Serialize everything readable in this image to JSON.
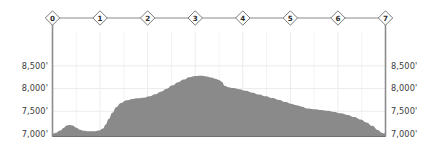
{
  "chart_data": {
    "type": "area",
    "title": "",
    "subtitle": "",
    "xlabel": "",
    "ylabel": "",
    "ylim": [
      6900,
      8800
    ],
    "xlim": [
      0,
      7
    ],
    "grid": true,
    "legend": "none",
    "y_ticks": [
      7000,
      7500,
      8000,
      8500
    ],
    "y_tick_labels_left": [
      "7,000'",
      "7,500'",
      "8,000'",
      "8,500'"
    ],
    "y_tick_labels_right": [
      "7,000'",
      "7,500'",
      "8,000'",
      "8,500'"
    ],
    "x_markers": [
      {
        "label": "0",
        "x": 0
      },
      {
        "label": "1",
        "x": 1
      },
      {
        "label": "2",
        "x": 2
      },
      {
        "label": "3",
        "x": 3
      },
      {
        "label": "4",
        "x": 4
      },
      {
        "label": "5",
        "x": 5
      },
      {
        "label": "6",
        "x": 6
      },
      {
        "label": "7",
        "x": 7
      }
    ],
    "series": [
      {
        "name": "Elevation profile",
        "fill_color": "#8a8a8a",
        "x": [
          0.0,
          0.08,
          0.16,
          0.24,
          0.3,
          0.36,
          0.42,
          0.5,
          0.58,
          0.66,
          0.74,
          0.82,
          0.9,
          0.98,
          1.06,
          1.12,
          1.18,
          1.26,
          1.34,
          1.44,
          1.56,
          1.68,
          1.8,
          1.92,
          2.04,
          2.16,
          2.28,
          2.4,
          2.52,
          2.64,
          2.76,
          2.88,
          3.0,
          3.12,
          3.24,
          3.34,
          3.42,
          3.5,
          3.56,
          3.62,
          3.7,
          3.8,
          3.92,
          4.06,
          4.2,
          4.34,
          4.48,
          4.62,
          4.76,
          4.9,
          5.02,
          5.1,
          5.16,
          5.24,
          5.36,
          5.5,
          5.64,
          5.78,
          5.92,
          6.06,
          6.2,
          6.34,
          6.48,
          6.6,
          6.72,
          6.84,
          6.92,
          6.98,
          7.0
        ],
        "values": [
          7010,
          7030,
          7075,
          7140,
          7185,
          7200,
          7185,
          7140,
          7095,
          7070,
          7060,
          7058,
          7060,
          7075,
          7120,
          7210,
          7330,
          7470,
          7590,
          7680,
          7740,
          7770,
          7785,
          7800,
          7830,
          7875,
          7930,
          7995,
          8070,
          8140,
          8200,
          8250,
          8275,
          8280,
          8265,
          8240,
          8215,
          8190,
          8150,
          8060,
          8030,
          8010,
          7985,
          7950,
          7910,
          7870,
          7830,
          7790,
          7750,
          7705,
          7665,
          7640,
          7625,
          7600,
          7560,
          7545,
          7530,
          7510,
          7485,
          7455,
          7420,
          7375,
          7320,
          7255,
          7180,
          7090,
          7030,
          7010,
          7070
        ]
      }
    ]
  },
  "accent_colors": {
    "terrain_fill": "#8a8a8a",
    "axis_line": "#8c8c8c",
    "grid_line": "#ececec",
    "marker_stroke": "#7a7a7a",
    "marker_fill": "#ffffff",
    "text": "#3b3b3b"
  }
}
